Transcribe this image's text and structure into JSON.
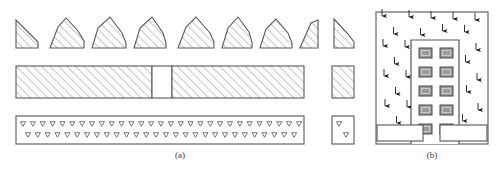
{
  "figure": {
    "panels": [
      {
        "id": "a",
        "caption": "(a)",
        "label": "map-symbol-legend-panel"
      },
      {
        "id": "b",
        "caption": "(b)",
        "label": "building-section-panel"
      }
    ]
  },
  "colors": {
    "stroke": "#58585a",
    "stroke_dark": "#3f3f41",
    "hatch": "#8d8d90",
    "window_fill": "#9a9a9c",
    "window_stroke": "#4a4a4c",
    "arrow": "#1d1d1f",
    "background": "#ffffff",
    "caption_text": "#3a3a3a"
  },
  "panel_a": {
    "row_mound": {
      "name": "hatched-mound-symbol-row",
      "count": 8,
      "isolated_count": 1,
      "shapes": [
        {
          "index": 1,
          "x": 16,
          "width": 22,
          "height": 30,
          "form": "right-triangle-mound",
          "peak_offset": 0.0
        },
        {
          "index": 2,
          "x": 50,
          "width": 34,
          "height": 32,
          "form": "pentagon-mound",
          "peak_offset": 0.38
        },
        {
          "index": 3,
          "x": 92,
          "width": 34,
          "height": 32,
          "form": "pentagon-mound",
          "peak_offset": 0.55
        },
        {
          "index": 4,
          "x": 134,
          "width": 32,
          "height": 31,
          "form": "pentagon-mound",
          "peak_offset": 0.6
        },
        {
          "index": 5,
          "x": 178,
          "width": 36,
          "height": 32,
          "form": "pentagon-mound",
          "peak_offset": 0.42
        },
        {
          "index": 6,
          "x": 222,
          "width": 30,
          "height": 31,
          "form": "pentagon-mound",
          "peak_offset": 0.5
        },
        {
          "index": 7,
          "x": 260,
          "width": 32,
          "height": 30,
          "form": "pentagon-mound",
          "peak_offset": 0.45
        },
        {
          "index": 8,
          "x": 300,
          "width": 20,
          "height": 28,
          "form": "right-triangle-mound",
          "peak_offset": 1.0
        }
      ],
      "isolated": {
        "index": 9,
        "x": 332,
        "width": 22,
        "height": 30,
        "form": "mirrored-triangle-mound"
      }
    },
    "row_bar": {
      "name": "diagonal-hatched-bar-row",
      "bar": {
        "x": 16,
        "y": 66,
        "width": 288,
        "height": 32
      },
      "gap": {
        "x": 152,
        "width": 20,
        "label": "bar-gap"
      },
      "isolated": {
        "x": 332,
        "y": 66,
        "width": 22,
        "height": 32,
        "label": "isolated-hatched-block"
      }
    },
    "row_triangles": {
      "name": "triangle-marker-bar-row",
      "bar": {
        "x": 16,
        "y": 116,
        "width": 288,
        "height": 28
      },
      "marker_glyph": "triangle-down-open",
      "rows": 2,
      "markers_per_row": 29,
      "isolated": {
        "x": 332,
        "y": 116,
        "width": 22,
        "height": 28,
        "markers": 2,
        "label": "isolated-triangle-block"
      }
    }
  },
  "panel_b": {
    "name": "building-section-with-arrow-field",
    "frame": {
      "x": 376,
      "y": 12,
      "width": 112,
      "height": 132
    },
    "building": {
      "name": "building-outline",
      "x": 411,
      "y": 40,
      "width": 48,
      "height": 104,
      "shape": "inverted-u"
    },
    "windows": {
      "name": "window-grid",
      "rows": 5,
      "columns": 2,
      "cell_width": 13,
      "cell_height": 10,
      "total": 10
    },
    "base_blocks": [
      {
        "index": 1,
        "x": 378,
        "y": 124,
        "width": 45,
        "height": 16,
        "label": "base-block-left"
      },
      {
        "index": 2,
        "x": 440,
        "y": 124,
        "width": 46,
        "height": 16,
        "label": "base-block-right"
      }
    ],
    "arrow_field": {
      "name": "downward-arrow-field",
      "direction": "down",
      "count": 46
    }
  }
}
